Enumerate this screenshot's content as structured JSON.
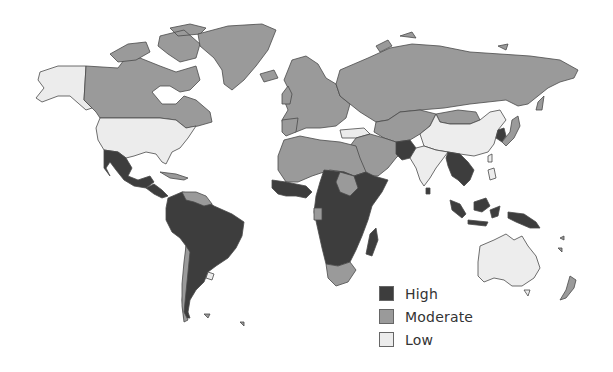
{
  "map": {
    "type": "choropleth",
    "title": "",
    "colors": {
      "high": "#3d3d3d",
      "moderate": "#9a9a9a",
      "low": "#ececec",
      "border": "#4a4a4a",
      "water": "#ffffff"
    },
    "regions": {
      "high": [
        "Mexico",
        "Central America",
        "South America (most)",
        "West Africa (parts)",
        "Central Africa",
        "East Africa",
        "Southern Africa (parts)",
        "Madagascar",
        "Pakistan",
        "Myanmar",
        "Thailand",
        "Indochina",
        "Korea",
        "Indonesia",
        "Papua New Guinea",
        "Sri Lanka"
      ],
      "moderate": [
        "Canada",
        "Greenland",
        "Iceland",
        "Europe",
        "Russia",
        "Central Asia",
        "Middle East",
        "North Africa",
        "South Africa",
        "Chile",
        "Guyana",
        "Japan",
        "Mongolia",
        "New Zealand",
        "Caribbean islands"
      ],
      "low": [
        "Alaska",
        "United States",
        "Turkey",
        "China",
        "India",
        "Australia",
        "Uruguay"
      ]
    }
  },
  "legend": {
    "items": [
      {
        "label": "High",
        "color": "#3d3d3d"
      },
      {
        "label": "Moderate",
        "color": "#9a9a9a"
      },
      {
        "label": "Low",
        "color": "#ececec"
      }
    ]
  }
}
